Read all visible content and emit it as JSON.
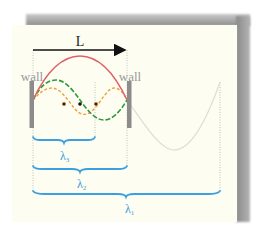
{
  "diagram": {
    "length_label": "L",
    "left_wall_label": "wall",
    "right_wall_label": "wall",
    "wavelength_labels": [
      {
        "symbol": "λ",
        "subscript": "3",
        "color": "#3aa0e0"
      },
      {
        "symbol": "λ",
        "subscript": "2",
        "color": "#3aa0e0"
      },
      {
        "symbol": "λ",
        "subscript": "1",
        "color": "#3aa0e0"
      }
    ],
    "waves": [
      {
        "name": "fundamental",
        "harmonic": 1,
        "color": "#e0606a",
        "style": "solid"
      },
      {
        "name": "second-harmonic",
        "harmonic": 2,
        "color": "#2f9a3a",
        "style": "dashed"
      },
      {
        "name": "third-harmonic",
        "harmonic": 3,
        "color": "#f0a040",
        "style": "dashed"
      },
      {
        "name": "fundamental-continuation",
        "color": "#d8d8d0",
        "style": "solid"
      }
    ],
    "colors": {
      "paper": "#fdfdf2",
      "wall": "#8c8c8c",
      "brace": "#3aa0e0",
      "label_gray": "#9a9a9a",
      "node_dot": "#222222"
    }
  }
}
